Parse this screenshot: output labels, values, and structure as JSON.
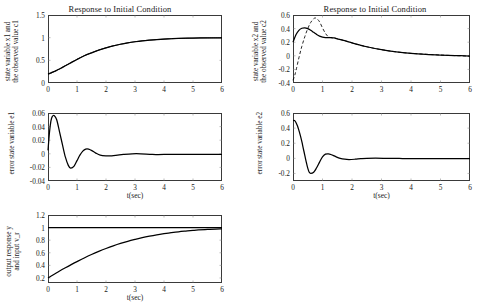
{
  "figure": {
    "background": "#ffffff",
    "line_color": "#000000",
    "axis_color": "#3a3a3a"
  },
  "panels": [
    {
      "id": "x1",
      "title": "Response to Initial Condition",
      "ylabel_line1": "state variable x1 and",
      "ylabel_line2": "the observed value c1",
      "xlabel": "",
      "yticks": [
        "0",
        "0.5",
        "1",
        "1.5"
      ],
      "xticks": [
        "0",
        "1",
        "2",
        "3",
        "4",
        "5",
        "6"
      ]
    },
    {
      "id": "x2",
      "title": "Response to Initial Condition",
      "ylabel_line1": "state variable x2 and",
      "ylabel_line2": "the observed value c2",
      "xlabel": "",
      "yticks": [
        "-0.4",
        "-0.2",
        "0",
        "0.2",
        "0.4",
        "0.6"
      ],
      "xticks": [
        "0",
        "1",
        "2",
        "3",
        "4",
        "5",
        "6"
      ]
    },
    {
      "id": "e1",
      "title": "",
      "ylabel_line1": "error state variable e1",
      "ylabel_line2": "",
      "xlabel": "t(sec)",
      "yticks": [
        "-0.04",
        "-0.02",
        "0",
        "0.02",
        "0.04",
        "0.06"
      ],
      "xticks": [
        "0",
        "1",
        "2",
        "3",
        "4",
        "5",
        "6"
      ]
    },
    {
      "id": "e2",
      "title": "",
      "ylabel_line1": "error state variable e2",
      "ylabel_line2": "",
      "xlabel": "t(sec)",
      "yticks": [
        "-0.2",
        "0",
        "0.2",
        "0.4",
        "0.6"
      ],
      "xticks": [
        "0",
        "1",
        "2",
        "3",
        "4",
        "5",
        "6"
      ]
    },
    {
      "id": "y",
      "title": "",
      "ylabel_line1": "output response y",
      "ylabel_line2": "and input v_r",
      "xlabel": "t(sec)",
      "yticks": [
        "0.2",
        "0.4",
        "0.6",
        "0.8",
        "1",
        "1.2"
      ],
      "xticks": [
        "0",
        "1",
        "2",
        "3",
        "4",
        "5",
        "6"
      ]
    }
  ],
  "chart_data": [
    {
      "type": "line",
      "id": "x1",
      "title": "Response to Initial Condition",
      "xlabel": "",
      "ylabel": "state variable x1 and the observed value c1",
      "xlim": [
        0,
        6
      ],
      "ylim": [
        0,
        1.5
      ],
      "xticks": [
        0,
        1,
        2,
        3,
        4,
        5,
        6
      ],
      "yticks": [
        0,
        0.5,
        1,
        1.5
      ],
      "grid": false,
      "legend": "none",
      "series": [
        {
          "name": "state variable x1",
          "style": "solid",
          "x": [
            0,
            0.1,
            0.2,
            0.3,
            0.4,
            0.5,
            0.6,
            0.8,
            1.0,
            1.25,
            1.5,
            1.75,
            2.0,
            2.25,
            2.5,
            2.75,
            3.0,
            3.25,
            3.5,
            3.75,
            4.0,
            4.25,
            4.5,
            5.0,
            5.5,
            6.0
          ],
          "y": [
            0.2,
            0.225,
            0.25,
            0.28,
            0.31,
            0.345,
            0.38,
            0.45,
            0.52,
            0.6,
            0.665,
            0.725,
            0.775,
            0.82,
            0.855,
            0.885,
            0.91,
            0.93,
            0.945,
            0.958,
            0.968,
            0.976,
            0.982,
            0.99,
            0.995,
            0.998
          ]
        },
        {
          "name": "the observed value c1",
          "style": "solid-thin",
          "x": [
            0,
            0.1,
            0.2,
            0.3,
            0.4,
            0.5,
            0.6,
            0.8,
            1.0,
            1.25,
            1.5,
            1.75,
            2.0,
            2.25,
            2.5,
            2.75,
            3.0,
            3.25,
            3.5,
            3.75,
            4.0,
            4.25,
            4.5,
            5.0,
            5.5,
            6.0
          ],
          "y": [
            0.19,
            0.215,
            0.245,
            0.278,
            0.312,
            0.348,
            0.384,
            0.452,
            0.522,
            0.602,
            0.667,
            0.727,
            0.777,
            0.821,
            0.856,
            0.886,
            0.911,
            0.931,
            0.946,
            0.959,
            0.969,
            0.977,
            0.983,
            0.99,
            0.995,
            0.998
          ]
        }
      ]
    },
    {
      "type": "line",
      "id": "x2",
      "title": "Response to Initial Condition",
      "xlabel": "",
      "ylabel": "state variable x2 and the observed value c2",
      "xlim": [
        0,
        6
      ],
      "ylim": [
        -0.4,
        0.6
      ],
      "xticks": [
        0,
        1,
        2,
        3,
        4,
        5,
        6
      ],
      "yticks": [
        -0.4,
        -0.2,
        0,
        0.2,
        0.4,
        0.6
      ],
      "grid": false,
      "legend": "none",
      "series": [
        {
          "name": "state variable x2",
          "style": "solid",
          "x": [
            0,
            0.1,
            0.2,
            0.3,
            0.4,
            0.5,
            0.6,
            0.7,
            0.8,
            0.9,
            1.0,
            1.1,
            1.2,
            1.3,
            1.4,
            1.5,
            1.75,
            2.0,
            2.25,
            2.5,
            3.0,
            3.5,
            4.0,
            4.5,
            5.0,
            5.5,
            6.0
          ],
          "y": [
            0.2,
            0.31,
            0.375,
            0.405,
            0.412,
            0.4,
            0.375,
            0.345,
            0.315,
            0.29,
            0.275,
            0.268,
            0.268,
            0.268,
            0.262,
            0.25,
            0.222,
            0.19,
            0.16,
            0.133,
            0.09,
            0.058,
            0.036,
            0.021,
            0.011,
            0.004,
            -0.005
          ]
        },
        {
          "name": "the observed value c2",
          "style": "dashed",
          "x": [
            0,
            0.05,
            0.1,
            0.2,
            0.3,
            0.4,
            0.5,
            0.6,
            0.7,
            0.75,
            0.8,
            0.9,
            1.0,
            1.1,
            1.2,
            1.3,
            1.4,
            1.5,
            1.75,
            2.0,
            2.5,
            3.0,
            3.5,
            4.0,
            5.0,
            6.0
          ],
          "y": [
            -0.36,
            -0.3,
            -0.22,
            -0.03,
            0.14,
            0.28,
            0.4,
            0.49,
            0.545,
            0.555,
            0.55,
            0.5,
            0.41,
            0.33,
            0.28,
            0.265,
            0.262,
            0.252,
            0.222,
            0.19,
            0.133,
            0.09,
            0.058,
            0.036,
            0.011,
            -0.005
          ]
        }
      ]
    },
    {
      "type": "line",
      "id": "e1",
      "title": "",
      "xlabel": "t(sec)",
      "ylabel": "error state variable e1",
      "xlim": [
        0,
        6
      ],
      "ylim": [
        -0.04,
        0.06
      ],
      "xticks": [
        0,
        1,
        2,
        3,
        4,
        5,
        6
      ],
      "yticks": [
        -0.04,
        -0.02,
        0,
        0.02,
        0.04,
        0.06
      ],
      "grid": false,
      "legend": "none",
      "series": [
        {
          "name": "error state variable e1",
          "style": "solid",
          "x": [
            0,
            0.05,
            0.1,
            0.15,
            0.22,
            0.3,
            0.4,
            0.5,
            0.6,
            0.7,
            0.78,
            0.9,
            1.0,
            1.1,
            1.2,
            1.3,
            1.4,
            1.5,
            1.65,
            1.8,
            2.0,
            2.2,
            2.4,
            2.6,
            2.9,
            3.2,
            3.6,
            4.0,
            5.0,
            6.0
          ],
          "y": [
            0.005,
            0.031,
            0.048,
            0.055,
            0.056,
            0.05,
            0.032,
            0.013,
            -0.005,
            -0.017,
            -0.021,
            -0.018,
            -0.01,
            -0.002,
            0.004,
            0.007,
            0.007,
            0.005,
            0.001,
            -0.002,
            -0.003,
            -0.003,
            -0.002,
            -0.001,
            0.0,
            0.0,
            -0.001,
            -0.001,
            -0.001,
            -0.001
          ]
        }
      ]
    },
    {
      "type": "line",
      "id": "e2",
      "title": "",
      "xlabel": "t(sec)",
      "ylabel": "error state variable e2",
      "xlim": [
        0,
        6
      ],
      "ylim": [
        -0.3,
        0.6
      ],
      "xticks": [
        0,
        1,
        2,
        3,
        4,
        5,
        6
      ],
      "yticks": [
        -0.2,
        0,
        0.2,
        0.4,
        0.6
      ],
      "grid": false,
      "legend": "none",
      "series": [
        {
          "name": "error state variable e2",
          "style": "solid",
          "x": [
            0,
            0.05,
            0.1,
            0.15,
            0.2,
            0.25,
            0.3,
            0.35,
            0.4,
            0.45,
            0.5,
            0.55,
            0.6,
            0.7,
            0.8,
            0.9,
            1.0,
            1.1,
            1.2,
            1.3,
            1.45,
            1.6,
            1.75,
            1.9,
            2.1,
            2.3,
            2.5,
            2.8,
            3.2,
            3.6,
            4.0,
            5.0,
            6.0
          ],
          "y": [
            0.5,
            0.5,
            0.475,
            0.43,
            0.37,
            0.3,
            0.22,
            0.13,
            0.04,
            -0.05,
            -0.13,
            -0.185,
            -0.2,
            -0.185,
            -0.125,
            -0.05,
            0.02,
            0.055,
            0.06,
            0.048,
            0.022,
            0.0,
            -0.012,
            -0.016,
            -0.012,
            -0.005,
            0.0,
            0.002,
            0.0,
            -0.002,
            -0.003,
            -0.004,
            -0.005
          ]
        }
      ]
    },
    {
      "type": "line",
      "id": "y",
      "title": "",
      "xlabel": "t(sec)",
      "ylabel": "output response y and input v_r",
      "xlim": [
        0,
        6
      ],
      "ylim": [
        0.12,
        1.2
      ],
      "xticks": [
        0,
        1,
        2,
        3,
        4,
        5,
        6
      ],
      "yticks": [
        0.2,
        0.4,
        0.6,
        0.8,
        1,
        1.2
      ],
      "grid": false,
      "legend": "none",
      "series": [
        {
          "name": "input v_r",
          "style": "solid",
          "x": [
            0,
            6
          ],
          "y": [
            1.0,
            1.0
          ]
        },
        {
          "name": "output response y",
          "style": "solid",
          "x": [
            0,
            0.2,
            0.4,
            0.6,
            0.8,
            1.0,
            1.25,
            1.5,
            1.75,
            2.0,
            2.25,
            2.5,
            2.75,
            3.0,
            3.25,
            3.5,
            3.75,
            4.0,
            4.25,
            4.5,
            4.75,
            5.0,
            5.5,
            6.0
          ],
          "y": [
            0.2,
            0.255,
            0.31,
            0.362,
            0.412,
            0.46,
            0.518,
            0.572,
            0.622,
            0.668,
            0.71,
            0.748,
            0.782,
            0.812,
            0.84,
            0.864,
            0.885,
            0.903,
            0.919,
            0.933,
            0.944,
            0.954,
            0.97,
            0.981
          ]
        }
      ]
    }
  ]
}
